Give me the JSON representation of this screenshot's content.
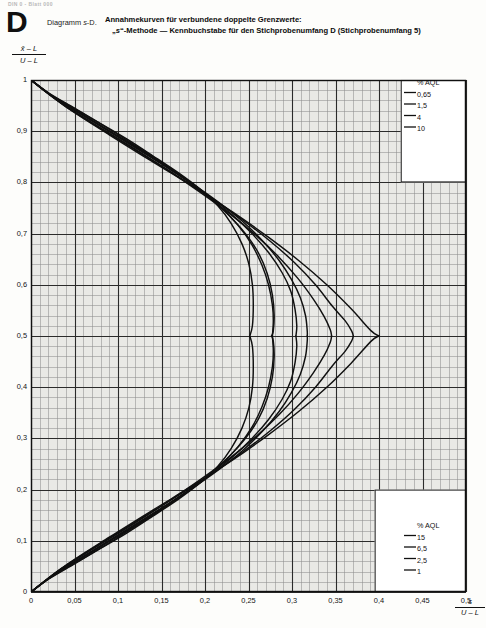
{
  "running_head": "DIN 0 - Blatt 000",
  "header": {
    "letter": "D",
    "diagram_ref_prefix": "Diagramm ",
    "diagram_ref_italic": "s",
    "diagram_ref_suffix": "-D.",
    "title_line1": "Annahmekurven für verbundene doppelte Grenzwerte:",
    "title_line2_pre": "„",
    "title_line2_italic": "s",
    "title_line2_post": "“-Methode — Kennbuchstabe für den Stichprobenumfang D (Stichprobenumfang 5)"
  },
  "axes": {
    "y_label_numerator": "x̄ – L",
    "y_label_denominator": "U – L",
    "x_label_numerator": "s",
    "x_label_denominator": "U – L",
    "y_ticks": [
      "1",
      "0,9",
      "0,8",
      "0,7",
      "0,6",
      "0,5",
      "0,4",
      "0,3",
      "0,2",
      "0,1",
      "0"
    ],
    "x_ticks": [
      "0",
      "0,05",
      "0,1",
      "0,15",
      "0,2",
      "0,25",
      "0,3",
      "0,35",
      "0,4",
      "0,45",
      "0,5"
    ]
  },
  "legend_top": {
    "title": "% AQL",
    "items": [
      "0,65",
      "1,5",
      "4",
      "10"
    ]
  },
  "legend_bottom": {
    "title": "% AQL",
    "items": [
      "15",
      "6,5",
      "2,5",
      "1"
    ]
  },
  "colors": {
    "ink": "#101010",
    "grid_minor": "#8d8d8d",
    "grid_major": "#2b2b2b",
    "paper": "#e9e9e6"
  },
  "chart_data": {
    "type": "line",
    "title": "Annahmekurven für verbundene doppelte Grenzwerte: „s“-Methode — Kennbuchstabe für den Stichprobenumfang D (Stichprobenumfang 5)",
    "subtitle": "Diagramm s-D.",
    "xlabel": "s / (U – L)",
    "ylabel": "(x̄ – L) / (U – L)",
    "xlim": [
      0,
      0.5
    ],
    "ylim": [
      0,
      1
    ],
    "xticks": [
      0,
      0.05,
      0.1,
      0.15,
      0.2,
      0.25,
      0.3,
      0.35,
      0.4,
      0.45,
      0.5
    ],
    "yticks": [
      0,
      0.1,
      0.2,
      0.3,
      0.4,
      0.5,
      0.6,
      0.7,
      0.8,
      0.9,
      1
    ],
    "grid": true,
    "grid_minor_step_x": 0.01,
    "grid_minor_step_y": 0.02,
    "legend_position": [
      "upper-right",
      "lower-right"
    ],
    "note": "Each % AQL value is a single closed acceptance curve symmetric about (x̄-L)/(U-L)=0.5; the upper branch starts at (0,1), the lower branch starts at (0,0), and both branches meet at the curve's maximum s/(U-L).",
    "series": [
      {
        "name": "0,65",
        "label_group": "upper",
        "upper_branch": [
          [
            0,
            1
          ],
          [
            0.02,
            0.975
          ],
          [
            0.05,
            0.945
          ],
          [
            0.08,
            0.915
          ],
          [
            0.11,
            0.885
          ],
          [
            0.14,
            0.852
          ],
          [
            0.17,
            0.818
          ],
          [
            0.195,
            0.786
          ],
          [
            0.215,
            0.754
          ],
          [
            0.23,
            0.72
          ],
          [
            0.2425,
            0.68
          ],
          [
            0.2505,
            0.64
          ],
          [
            0.2545,
            0.6
          ],
          [
            0.2555,
            0.56
          ],
          [
            0.2545,
            0.52
          ],
          [
            0.2515,
            0.5
          ]
        ],
        "lower_branch": [
          [
            0,
            0
          ],
          [
            0.02,
            0.025
          ],
          [
            0.05,
            0.055
          ],
          [
            0.08,
            0.085
          ],
          [
            0.11,
            0.115
          ],
          [
            0.14,
            0.148
          ],
          [
            0.17,
            0.182
          ],
          [
            0.195,
            0.214
          ],
          [
            0.215,
            0.246
          ],
          [
            0.23,
            0.28
          ],
          [
            0.2425,
            0.32
          ],
          [
            0.2505,
            0.36
          ],
          [
            0.2545,
            0.4
          ],
          [
            0.2555,
            0.44
          ],
          [
            0.2545,
            0.48
          ],
          [
            0.2515,
            0.5
          ]
        ]
      },
      {
        "name": "1,5",
        "label_group": "upper",
        "upper_branch": [
          [
            0,
            1
          ],
          [
            0.025,
            0.968
          ],
          [
            0.06,
            0.932
          ],
          [
            0.095,
            0.896
          ],
          [
            0.13,
            0.86
          ],
          [
            0.163,
            0.823
          ],
          [
            0.193,
            0.787
          ],
          [
            0.218,
            0.752
          ],
          [
            0.238,
            0.716
          ],
          [
            0.254,
            0.678
          ],
          [
            0.2655,
            0.638
          ],
          [
            0.273,
            0.6
          ],
          [
            0.2775,
            0.56
          ],
          [
            0.2785,
            0.53
          ],
          [
            0.2775,
            0.5
          ]
        ],
        "lower_branch": [
          [
            0,
            0
          ],
          [
            0.025,
            0.032
          ],
          [
            0.06,
            0.068
          ],
          [
            0.095,
            0.104
          ],
          [
            0.13,
            0.14
          ],
          [
            0.163,
            0.177
          ],
          [
            0.193,
            0.213
          ],
          [
            0.218,
            0.248
          ],
          [
            0.238,
            0.284
          ],
          [
            0.254,
            0.322
          ],
          [
            0.2655,
            0.362
          ],
          [
            0.273,
            0.4
          ],
          [
            0.2775,
            0.44
          ],
          [
            0.2785,
            0.47
          ],
          [
            0.2775,
            0.5
          ]
        ]
      },
      {
        "name": "4",
        "label_group": "upper",
        "upper_branch": [
          [
            0,
            1
          ],
          [
            0.03,
            0.962
          ],
          [
            0.07,
            0.92
          ],
          [
            0.11,
            0.878
          ],
          [
            0.148,
            0.838
          ],
          [
            0.183,
            0.8
          ],
          [
            0.215,
            0.762
          ],
          [
            0.243,
            0.724
          ],
          [
            0.266,
            0.686
          ],
          [
            0.285,
            0.648
          ],
          [
            0.2995,
            0.61
          ],
          [
            0.3095,
            0.575
          ],
          [
            0.3155,
            0.54
          ],
          [
            0.3175,
            0.51
          ],
          [
            0.3175,
            0.5
          ]
        ],
        "lower_branch": [
          [
            0,
            0
          ],
          [
            0.03,
            0.038
          ],
          [
            0.07,
            0.08
          ],
          [
            0.11,
            0.122
          ],
          [
            0.148,
            0.162
          ],
          [
            0.183,
            0.2
          ],
          [
            0.215,
            0.238
          ],
          [
            0.243,
            0.276
          ],
          [
            0.266,
            0.314
          ],
          [
            0.285,
            0.352
          ],
          [
            0.2995,
            0.39
          ],
          [
            0.3095,
            0.425
          ],
          [
            0.3155,
            0.46
          ],
          [
            0.3175,
            0.49
          ],
          [
            0.3175,
            0.5
          ]
        ]
      },
      {
        "name": "10",
        "label_group": "upper",
        "upper_branch": [
          [
            0,
            1
          ],
          [
            0.035,
            0.954
          ],
          [
            0.08,
            0.905
          ],
          [
            0.125,
            0.858
          ],
          [
            0.168,
            0.813
          ],
          [
            0.207,
            0.77
          ],
          [
            0.243,
            0.727
          ],
          [
            0.275,
            0.685
          ],
          [
            0.303,
            0.643
          ],
          [
            0.327,
            0.6
          ],
          [
            0.3465,
            0.558
          ],
          [
            0.361,
            0.53
          ],
          [
            0.3685,
            0.51
          ],
          [
            0.3705,
            0.5
          ]
        ],
        "lower_branch": [
          [
            0,
            0
          ],
          [
            0.035,
            0.046
          ],
          [
            0.08,
            0.095
          ],
          [
            0.125,
            0.142
          ],
          [
            0.168,
            0.187
          ],
          [
            0.207,
            0.23
          ],
          [
            0.243,
            0.273
          ],
          [
            0.275,
            0.315
          ],
          [
            0.303,
            0.357
          ],
          [
            0.327,
            0.4
          ],
          [
            0.3465,
            0.442
          ],
          [
            0.361,
            0.47
          ],
          [
            0.3685,
            0.49
          ],
          [
            0.3705,
            0.5
          ]
        ]
      },
      {
        "name": "15",
        "label_group": "lower",
        "upper_branch": [
          [
            0,
            1
          ],
          [
            0.04,
            0.948
          ],
          [
            0.09,
            0.893
          ],
          [
            0.14,
            0.84
          ],
          [
            0.188,
            0.79
          ],
          [
            0.232,
            0.742
          ],
          [
            0.272,
            0.694
          ],
          [
            0.308,
            0.647
          ],
          [
            0.34,
            0.6
          ],
          [
            0.368,
            0.553
          ],
          [
            0.391,
            0.51
          ],
          [
            0.4,
            0.5
          ]
        ],
        "lower_branch": [
          [
            0,
            0
          ],
          [
            0.04,
            0.052
          ],
          [
            0.09,
            0.107
          ],
          [
            0.14,
            0.16
          ],
          [
            0.188,
            0.21
          ],
          [
            0.232,
            0.258
          ],
          [
            0.272,
            0.306
          ],
          [
            0.308,
            0.353
          ],
          [
            0.34,
            0.4
          ],
          [
            0.368,
            0.447
          ],
          [
            0.391,
            0.49
          ],
          [
            0.4,
            0.5
          ]
        ]
      },
      {
        "name": "6,5",
        "label_group": "lower",
        "upper_branch": [
          [
            0,
            1
          ],
          [
            0.032,
            0.958
          ],
          [
            0.075,
            0.912
          ],
          [
            0.118,
            0.867
          ],
          [
            0.158,
            0.823
          ],
          [
            0.195,
            0.78
          ],
          [
            0.229,
            0.738
          ],
          [
            0.259,
            0.696
          ],
          [
            0.285,
            0.654
          ],
          [
            0.307,
            0.612
          ],
          [
            0.3245,
            0.572
          ],
          [
            0.337,
            0.538
          ],
          [
            0.344,
            0.512
          ],
          [
            0.3455,
            0.5
          ]
        ],
        "lower_branch": [
          [
            0,
            0
          ],
          [
            0.032,
            0.042
          ],
          [
            0.075,
            0.088
          ],
          [
            0.118,
            0.133
          ],
          [
            0.158,
            0.177
          ],
          [
            0.195,
            0.22
          ],
          [
            0.229,
            0.262
          ],
          [
            0.259,
            0.304
          ],
          [
            0.285,
            0.346
          ],
          [
            0.307,
            0.388
          ],
          [
            0.3245,
            0.428
          ],
          [
            0.337,
            0.462
          ],
          [
            0.344,
            0.488
          ],
          [
            0.3455,
            0.5
          ]
        ]
      },
      {
        "name": "2,5",
        "label_group": "lower",
        "upper_branch": [
          [
            0,
            1
          ],
          [
            0.027,
            0.965
          ],
          [
            0.065,
            0.926
          ],
          [
            0.103,
            0.887
          ],
          [
            0.139,
            0.849
          ],
          [
            0.173,
            0.811
          ],
          [
            0.204,
            0.774
          ],
          [
            0.231,
            0.737
          ],
          [
            0.254,
            0.7
          ],
          [
            0.2735,
            0.662
          ],
          [
            0.2885,
            0.624
          ],
          [
            0.2985,
            0.588
          ],
          [
            0.3035,
            0.552
          ],
          [
            0.3055,
            0.52
          ],
          [
            0.3045,
            0.5
          ]
        ],
        "lower_branch": [
          [
            0,
            0
          ],
          [
            0.027,
            0.035
          ],
          [
            0.065,
            0.074
          ],
          [
            0.103,
            0.113
          ],
          [
            0.139,
            0.151
          ],
          [
            0.173,
            0.189
          ],
          [
            0.204,
            0.226
          ],
          [
            0.231,
            0.263
          ],
          [
            0.254,
            0.3
          ],
          [
            0.2735,
            0.338
          ],
          [
            0.2885,
            0.376
          ],
          [
            0.2985,
            0.412
          ],
          [
            0.3035,
            0.448
          ],
          [
            0.3055,
            0.48
          ],
          [
            0.3045,
            0.5
          ]
        ]
      },
      {
        "name": "1",
        "label_group": "lower",
        "upper_branch": [
          [
            0,
            1
          ],
          [
            0.022,
            0.972
          ],
          [
            0.055,
            0.939
          ],
          [
            0.088,
            0.906
          ],
          [
            0.12,
            0.872
          ],
          [
            0.151,
            0.838
          ],
          [
            0.18,
            0.804
          ],
          [
            0.206,
            0.77
          ],
          [
            0.228,
            0.735
          ],
          [
            0.2465,
            0.7
          ],
          [
            0.2615,
            0.662
          ],
          [
            0.2715,
            0.622
          ],
          [
            0.2775,
            0.58
          ],
          [
            0.2795,
            0.54
          ],
          [
            0.2785,
            0.51
          ],
          [
            0.2765,
            0.5
          ]
        ],
        "lower_branch": [
          [
            0,
            0
          ],
          [
            0.022,
            0.028
          ],
          [
            0.055,
            0.061
          ],
          [
            0.088,
            0.094
          ],
          [
            0.12,
            0.128
          ],
          [
            0.151,
            0.162
          ],
          [
            0.18,
            0.196
          ],
          [
            0.206,
            0.23
          ],
          [
            0.228,
            0.265
          ],
          [
            0.2465,
            0.3
          ],
          [
            0.2615,
            0.338
          ],
          [
            0.2715,
            0.378
          ],
          [
            0.2775,
            0.42
          ],
          [
            0.2795,
            0.46
          ],
          [
            0.2785,
            0.49
          ],
          [
            0.2765,
            0.5
          ]
        ]
      }
    ],
    "legend_leader_lines": {
      "top": [
        [
          0.845,
          0.845,
          0.872,
          0.872
        ],
        [
          0.845,
          0.845,
          0.872,
          0.872
        ]
      ],
      "note": "short horizontal leaders drawn from grid edge to each legend label"
    }
  }
}
